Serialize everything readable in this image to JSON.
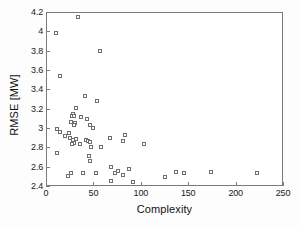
{
  "chart_data": {
    "type": "scatter",
    "title": "",
    "xlabel": "Complexity",
    "ylabel": "RMSE [MW]",
    "xlim": [
      0,
      250
    ],
    "ylim": [
      2.4,
      4.2
    ],
    "xticks": [
      0,
      50,
      100,
      150,
      200,
      250
    ],
    "xtick_labels": [
      "0",
      "50",
      "100",
      "150",
      "200",
      "250"
    ],
    "yticks": [
      2.4,
      2.6,
      2.8,
      3.0,
      3.2,
      3.4,
      3.6,
      3.8,
      4.0,
      4.2
    ],
    "ytick_labels": [
      "2.4",
      "2.6",
      "2.8",
      "3",
      "3.2",
      "3.4",
      "3.6",
      "3.8",
      "4",
      "4.2"
    ],
    "grid": false,
    "legend": null,
    "marker": "open-square",
    "marker_color": "#6e6e6e",
    "series": [
      {
        "name": "models",
        "points": [
          [
            33,
            4.16
          ],
          [
            10,
            3.99
          ],
          [
            56,
            3.81
          ],
          [
            14,
            3.55
          ],
          [
            40,
            3.34
          ],
          [
            53,
            3.29
          ],
          [
            31,
            3.22
          ],
          [
            27,
            3.16
          ],
          [
            26,
            3.13
          ],
          [
            28,
            3.13
          ],
          [
            36,
            3.12
          ],
          [
            42,
            3.1
          ],
          [
            25,
            3.07
          ],
          [
            30,
            3.06
          ],
          [
            28,
            3.04
          ],
          [
            45,
            3.04
          ],
          [
            49,
            3.01
          ],
          [
            11,
            3.0
          ],
          [
            14,
            2.97
          ],
          [
            23,
            2.96
          ],
          [
            19,
            2.93
          ],
          [
            82,
            2.94
          ],
          [
            24,
            2.91
          ],
          [
            66,
            2.91
          ],
          [
            31,
            2.9
          ],
          [
            27,
            2.89
          ],
          [
            41,
            2.89
          ],
          [
            43,
            2.88
          ],
          [
            80,
            2.88
          ],
          [
            45,
            2.87
          ],
          [
            29,
            2.86
          ],
          [
            102,
            2.85
          ],
          [
            26,
            2.84
          ],
          [
            35,
            2.84
          ],
          [
            46,
            2.81
          ],
          [
            57,
            2.81
          ],
          [
            11,
            2.75
          ],
          [
            44,
            2.72
          ],
          [
            45,
            2.67
          ],
          [
            67,
            2.61
          ],
          [
            86,
            2.59
          ],
          [
            75,
            2.57
          ],
          [
            136,
            2.56
          ],
          [
            173,
            2.56
          ],
          [
            72,
            2.55
          ],
          [
            145,
            2.55
          ],
          [
            222,
            2.55
          ],
          [
            25,
            2.55
          ],
          [
            38,
            2.55
          ],
          [
            52,
            2.55
          ],
          [
            80,
            2.52
          ],
          [
            124,
            2.5
          ],
          [
            22,
            2.51
          ],
          [
            68,
            2.46
          ],
          [
            91,
            2.45
          ]
        ]
      }
    ]
  }
}
